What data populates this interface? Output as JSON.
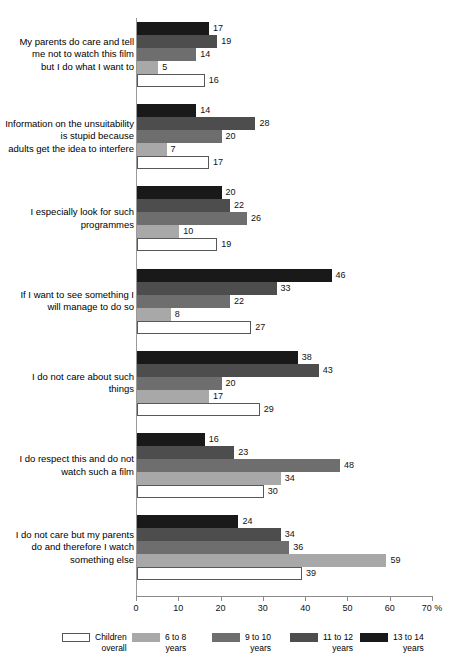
{
  "chart_data": {
    "type": "bar",
    "orientation": "horizontal",
    "title": "",
    "subtitle": "",
    "xlabel": "",
    "ylabel": "",
    "xlim": [
      0,
      70
    ],
    "xunit": "%",
    "grid": false,
    "legend_position": "bottom",
    "axis": {
      "ticks": [
        {
          "value": 0,
          "label": "0"
        },
        {
          "value": 10,
          "label": "10"
        },
        {
          "value": 20,
          "label": "20"
        },
        {
          "value": 30,
          "label": "30"
        },
        {
          "value": 40,
          "label": "40"
        },
        {
          "value": 50,
          "label": "50"
        },
        {
          "value": 60,
          "label": "60"
        },
        {
          "value": 70,
          "label": "70 %"
        }
      ]
    },
    "categories": [
      "My parents do care and tell me not to watch this film but I do what I want to",
      "Information on the unsuitability is stupid because adults get the idea to interfere",
      "I especially look for such programmes",
      "If I want to see something I will manage to do so",
      "I do not care about such things",
      "I do respect this and do not watch such a film",
      "I do not care but my parents do and therefore I watch something else"
    ],
    "series": [
      {
        "name": "13 to 14 years",
        "color": "#191919",
        "values": [
          17,
          14,
          20,
          46,
          38,
          16,
          24
        ]
      },
      {
        "name": "11 to 12 years",
        "color": "#4d4d4d",
        "values": [
          19,
          28,
          22,
          33,
          43,
          23,
          34
        ]
      },
      {
        "name": "9 to 10 years",
        "color": "#6e6e6e",
        "values": [
          14,
          20,
          26,
          22,
          20,
          48,
          36
        ]
      },
      {
        "name": "6 to 8 years",
        "color": "#a8a8a8",
        "values": [
          5,
          7,
          10,
          8,
          17,
          34,
          59
        ]
      },
      {
        "name": "Children overall",
        "color": "#ffffff",
        "values": [
          16,
          17,
          19,
          27,
          29,
          30,
          39
        ]
      }
    ]
  },
  "legend": {
    "items": [
      {
        "label": "Children\noverall",
        "color": "#ffffff",
        "outline": true
      },
      {
        "label": "6 to 8\nyears",
        "color": "#a8a8a8",
        "outline": false
      },
      {
        "label": "9 to 10\nyears",
        "color": "#6e6e6e",
        "outline": false
      },
      {
        "label": "11 to 12\nyears",
        "color": "#4d4d4d",
        "outline": false
      },
      {
        "label": "13 to 14\nyears",
        "color": "#191919",
        "outline": false
      }
    ]
  },
  "category_lines": [
    [
      "My parents do care and tell",
      "me not to watch this film",
      "but I do what I want to"
    ],
    [
      "Information on the unsuitability",
      "is stupid because",
      "adults get the idea to interfere"
    ],
    [
      "I especially look for such",
      "programmes"
    ],
    [
      "If I want to see something I",
      "will manage to do so"
    ],
    [
      "I do not care about such",
      "things"
    ],
    [
      "I do respect this and do not",
      "watch such a film"
    ],
    [
      "I do not care but my parents",
      "do and therefore I watch",
      "something else"
    ]
  ]
}
